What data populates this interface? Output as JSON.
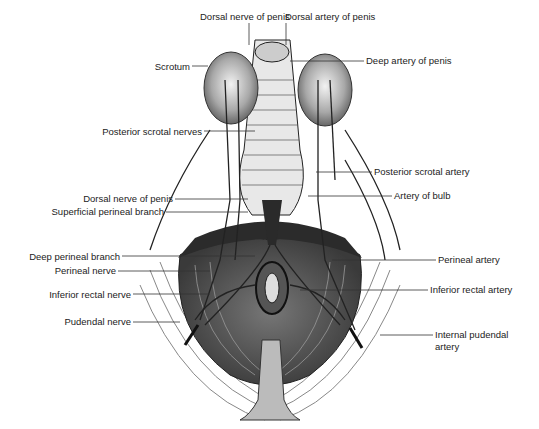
{
  "figure": {
    "labels_left": [
      {
        "id": "scrotum",
        "text": "Scrotum"
      },
      {
        "id": "posterior-scrotal-nerves",
        "text": "Posterior scrotal nerves"
      },
      {
        "id": "dorsal-nerve-of-penis-lower",
        "text": "Dorsal nerve of penis"
      },
      {
        "id": "superficial-perineal-branch",
        "text": "Superficial perineal branch"
      },
      {
        "id": "deep-perineal-branch",
        "text": "Deep perineal branch"
      },
      {
        "id": "perineal-nerve",
        "text": "Perineal nerve"
      },
      {
        "id": "inferior-rectal-nerve",
        "text": "Inferior rectal nerve"
      },
      {
        "id": "pudendal-nerve",
        "text": "Pudendal nerve"
      }
    ],
    "labels_top": [
      {
        "id": "dorsal-nerve-of-penis-top",
        "text": "Dorsal nerve of penis"
      },
      {
        "id": "dorsal-artery-of-penis",
        "text": "Dorsal artery of penis"
      }
    ],
    "labels_right": [
      {
        "id": "deep-artery-of-penis",
        "text": "Deep artery of penis"
      },
      {
        "id": "posterior-scrotal-artery",
        "text": "Posterior scrotal artery"
      },
      {
        "id": "artery-of-bulb",
        "text": "Artery of bulb"
      },
      {
        "id": "perineal-artery",
        "text": "Perineal artery"
      },
      {
        "id": "inferior-rectal-artery",
        "text": "Inferior rectal artery"
      },
      {
        "id": "internal-pudendal-artery-1",
        "text": "Internal pudendal"
      },
      {
        "id": "internal-pudendal-artery-2",
        "text": "artery"
      }
    ]
  }
}
